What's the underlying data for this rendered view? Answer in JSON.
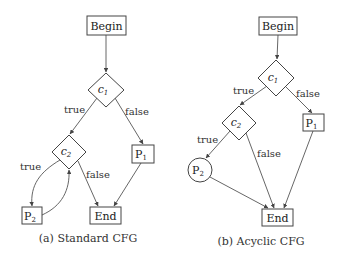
{
  "figure": {
    "panels": [
      {
        "id": "a",
        "caption": "(a) Standard CFG",
        "nodes": {
          "begin": "Begin",
          "c1": "c",
          "c1_sub": "1",
          "c2": "c",
          "c2_sub": "2",
          "p1": "P",
          "p1_sub": "1",
          "p2": "P",
          "p2_sub": "2",
          "end": "End"
        },
        "edge_labels": {
          "c1_true": "true",
          "c1_false": "false",
          "c2_true": "true",
          "c2_false": "false"
        }
      },
      {
        "id": "b",
        "caption": "(b) Acyclic CFG",
        "nodes": {
          "begin": "Begin",
          "c1": "c",
          "c1_sub": "1",
          "c2": "c",
          "c2_sub": "2",
          "p1": "P",
          "p1_sub": "1",
          "p2": "P",
          "p2_sub": "2",
          "end": "End"
        },
        "edge_labels": {
          "c1_true": "true",
          "c1_false": "false",
          "c2_true": "true",
          "c2_false": "false"
        }
      }
    ],
    "colors": {
      "stroke": "#444444",
      "text": "#222222",
      "background": "#ffffff"
    }
  }
}
